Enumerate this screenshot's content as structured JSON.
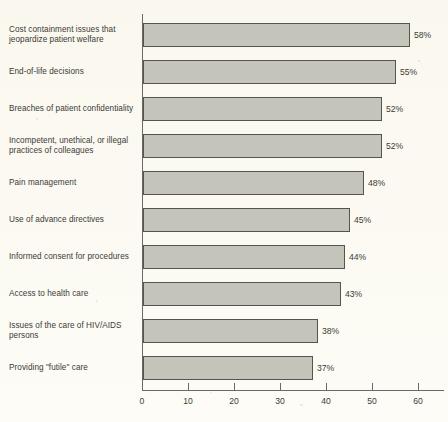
{
  "chart_data": {
    "type": "bar",
    "orientation": "horizontal",
    "title": "",
    "subtitle": "",
    "xlabel": "",
    "ylabel": "",
    "xlim": [
      0,
      65
    ],
    "grid": false,
    "legend": null,
    "value_suffix": "%",
    "categories": [
      "Cost containment issues that jeopardize patient welfare",
      "End-of-life decisions",
      "Breaches of patient confidentiality",
      "Incompetent, unethical, or illegal practices of colleagues",
      "Pain management",
      "Use of advance directives",
      "Informed consent for procedures",
      "Access to health care",
      "Issues of the care of HIV/AIDS persons",
      "Providing \"futile\" care"
    ],
    "values": [
      58,
      55,
      52,
      52,
      48,
      45,
      44,
      43,
      38,
      37
    ],
    "data_labels": [
      "58%",
      "55%",
      "52%",
      "52%",
      "48%",
      "45%",
      "44%",
      "43%",
      "38%",
      "37%"
    ],
    "xticks": [
      0,
      10,
      20,
      30,
      40,
      50,
      60
    ],
    "xtick_labels": [
      "0",
      "10",
      "20",
      "30",
      "40",
      "50",
      "60"
    ],
    "colors": {
      "bar_fill": "#c4c4bb",
      "bar_border": "#55554f",
      "axis": "#6a6a64",
      "text": "#3b3b38",
      "background": "#faf8ef"
    }
  }
}
